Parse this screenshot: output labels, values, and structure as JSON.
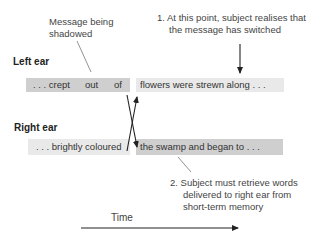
{
  "annotations": {
    "shadowed": [
      "Message being",
      "shadowed"
    ],
    "point1": [
      "1. At this point, subject realises that",
      "the message has switched"
    ],
    "point2": [
      "2. Subject must retrieve words",
      "delivered to right ear from",
      "short-term memory"
    ]
  },
  "left_ear": {
    "label": "Left ear",
    "before": {
      "words": [
        ". . . crept",
        "out",
        "of"
      ],
      "shade": "#cfcfcf"
    },
    "after": {
      "text": "flowers were strewn along . . .",
      "shade": "#e9e9e9"
    }
  },
  "right_ear": {
    "label": "Right ear",
    "before": {
      "text": ". . . brightly coloured",
      "shade": "#e9e9e9"
    },
    "after": {
      "text": "the swamp and began to . . .",
      "shade": "#cfcfcf"
    }
  },
  "time_axis": {
    "label": "Time"
  },
  "colors": {
    "line": "#222222",
    "pointer": "#555555",
    "shadowed_box": "#cfcfcf",
    "other_box": "#e9e9e9"
  }
}
